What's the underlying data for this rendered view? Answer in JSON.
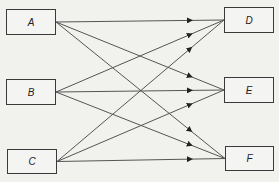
{
  "diagram": {
    "type": "bipartite-flow",
    "colors": {
      "background": "#f1f1ee",
      "line": "#555555",
      "box_border": "#3a3a3a"
    },
    "sources": [
      {
        "id": "A",
        "label": "A",
        "x": 6,
        "y": 9,
        "w": 50,
        "h": 26
      },
      {
        "id": "B",
        "label": "B",
        "x": 6,
        "y": 79,
        "w": 50,
        "h": 26
      },
      {
        "id": "C",
        "label": "C",
        "x": 7,
        "y": 149,
        "w": 50,
        "h": 25
      }
    ],
    "targets": [
      {
        "id": "D",
        "label": "D",
        "x": 224,
        "y": 7,
        "w": 50,
        "h": 26
      },
      {
        "id": "E",
        "label": "E",
        "x": 224,
        "y": 77,
        "w": 50,
        "h": 26
      },
      {
        "id": "F",
        "label": "F",
        "x": 225,
        "y": 146,
        "w": 49,
        "h": 25
      }
    ],
    "edges": [
      {
        "from": "A",
        "to": "D"
      },
      {
        "from": "A",
        "to": "E"
      },
      {
        "from": "A",
        "to": "F"
      },
      {
        "from": "B",
        "to": "D"
      },
      {
        "from": "B",
        "to": "E"
      },
      {
        "from": "B",
        "to": "F"
      },
      {
        "from": "C",
        "to": "D"
      },
      {
        "from": "C",
        "to": "E"
      },
      {
        "from": "C",
        "to": "F"
      }
    ]
  }
}
